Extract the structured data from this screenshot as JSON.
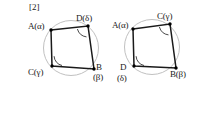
{
  "page": {
    "background_color": "#ffffff",
    "width": 199,
    "height": 120
  },
  "section_tag": "[2]",
  "style_colors": {
    "circle_stroke": "#b9b9b9",
    "polygon_stroke": "#1a1a1a",
    "vertex_fill": "#000000",
    "arc_stroke": "#1a1a1a",
    "text_color": "#1a1a1a"
  },
  "figures": [
    {
      "id": "left-figure",
      "name": "cyclic-quadrilateral-left",
      "circle": {
        "cx": 71,
        "cy": 48,
        "r": 27.5
      },
      "vertices": [
        {
          "key": "A",
          "label": "A(α)",
          "point_label": "A",
          "greek": "α",
          "x": 51,
          "y": 30,
          "label_x": 28,
          "label_y": 21,
          "has_arc": false
        },
        {
          "key": "D",
          "label": "D(δ)",
          "point_label": "D",
          "greek": "δ",
          "x": 88,
          "y": 26,
          "label_x": 76,
          "label_y": 13,
          "has_arc": true
        },
        {
          "key": "B",
          "label": "B",
          "point_label": "B",
          "greek": "β",
          "sub_label": "(β)",
          "x": 94,
          "y": 69,
          "label_x": 96,
          "label_y": 62,
          "sub_label_x": 93,
          "sub_label_y": 72,
          "has_arc": false
        },
        {
          "key": "C",
          "label": "C(γ)",
          "point_label": "C",
          "greek": "γ",
          "x": 52,
          "y": 66,
          "label_x": 28,
          "label_y": 67,
          "has_arc": true
        }
      ],
      "edges": [
        [
          "A",
          "D"
        ],
        [
          "D",
          "B"
        ],
        [
          "B",
          "C"
        ],
        [
          "C",
          "A"
        ]
      ],
      "angle_arcs": [
        {
          "at": "D",
          "start_deg": 196,
          "end_deg": 262,
          "radius": 11
        },
        {
          "at": "C",
          "start_deg": 282,
          "end_deg": 357,
          "radius": 10
        }
      ]
    },
    {
      "id": "right-figure",
      "name": "cyclic-quadrilateral-right",
      "circle": {
        "cx": 152,
        "cy": 47,
        "r": 27.5
      },
      "vertices": [
        {
          "key": "A",
          "label": "A(α)",
          "point_label": "A",
          "greek": "α",
          "x": 133,
          "y": 29,
          "label_x": 112,
          "label_y": 20,
          "has_arc": false
        },
        {
          "key": "C",
          "label": "C(γ)",
          "point_label": "C",
          "greek": "γ",
          "x": 170,
          "y": 24,
          "label_x": 157,
          "label_y": 11,
          "has_arc": true
        },
        {
          "key": "B",
          "label": "B(β)",
          "point_label": "B",
          "greek": "β",
          "x": 176,
          "y": 68,
          "label_x": 170,
          "label_y": 69,
          "has_arc": false
        },
        {
          "key": "D",
          "label": "D",
          "point_label": "D",
          "greek": "δ",
          "sub_label": "(δ)",
          "x": 134,
          "y": 66,
          "label_x": 120,
          "label_y": 62,
          "sub_label_x": 117,
          "sub_label_y": 73,
          "has_arc": true
        }
      ],
      "edges": [
        [
          "A",
          "C"
        ],
        [
          "C",
          "B"
        ],
        [
          "B",
          "D"
        ],
        [
          "D",
          "A"
        ]
      ],
      "angle_arcs": [
        {
          "at": "C",
          "start_deg": 196,
          "end_deg": 262,
          "radius": 11
        },
        {
          "at": "D",
          "start_deg": 282,
          "end_deg": 357,
          "radius": 10
        }
      ]
    }
  ]
}
